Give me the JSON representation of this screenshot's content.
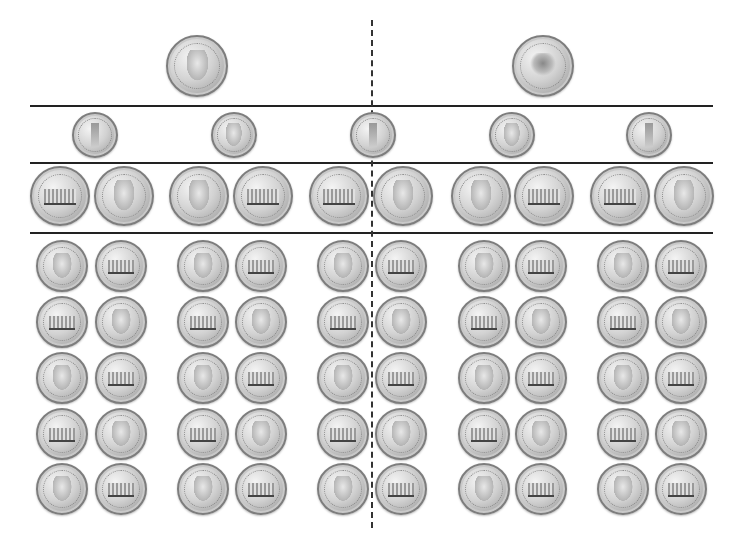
{
  "sheet": {
    "title": "",
    "layout": "coin equivalence chart: 1 quarter split into dimes, nickels, pennies",
    "colors": {
      "line": "#222222",
      "coin_silver": "#c8c8c8",
      "background": "#ffffff"
    }
  },
  "divider": {
    "style": "dashed",
    "orientation": "vertical",
    "x": 372
  },
  "rows": [
    {
      "name": "quarters",
      "y_center": 66,
      "radius": 31,
      "coins": [
        {
          "type": "quarter",
          "side": "heads",
          "x": 197,
          "top_text": "LIBERTY",
          "bottom_text": ""
        },
        {
          "type": "quarter",
          "side": "tails",
          "x": 543,
          "top_text": "UNITED STATES",
          "bottom_text": "QUARTER DOLLAR"
        }
      ]
    },
    {
      "name": "dimes",
      "y_center": 135,
      "radius": 23,
      "coins": [
        {
          "type": "dime",
          "side": "tails",
          "x": 95
        },
        {
          "type": "dime",
          "side": "heads",
          "x": 234
        },
        {
          "type": "dime",
          "side": "tails",
          "x": 373
        },
        {
          "type": "dime",
          "side": "heads",
          "x": 512
        },
        {
          "type": "dime",
          "side": "tails",
          "x": 649
        }
      ]
    },
    {
      "name": "nickels",
      "y_center": 196,
      "radius": 30,
      "coins": [
        {
          "type": "nickel",
          "side": "tails",
          "x": 60
        },
        {
          "type": "nickel",
          "side": "heads",
          "x": 124
        },
        {
          "type": "nickel",
          "side": "heads",
          "x": 199
        },
        {
          "type": "nickel",
          "side": "tails",
          "x": 263
        },
        {
          "type": "nickel",
          "side": "tails",
          "x": 339
        },
        {
          "type": "nickel",
          "side": "heads",
          "x": 403
        },
        {
          "type": "nickel",
          "side": "heads",
          "x": 481
        },
        {
          "type": "nickel",
          "side": "tails",
          "x": 544
        },
        {
          "type": "nickel",
          "side": "tails",
          "x": 620
        },
        {
          "type": "nickel",
          "side": "heads",
          "x": 684
        }
      ]
    }
  ],
  "pennies": {
    "radius": 26,
    "column_x": [
      62,
      121,
      203,
      261,
      343,
      401,
      484,
      541,
      623,
      681
    ],
    "row_y": [
      266,
      322,
      378,
      434,
      489
    ],
    "pattern": [
      [
        "heads",
        "tails"
      ],
      [
        "tails",
        "heads"
      ],
      [
        "heads",
        "tails"
      ],
      [
        "tails",
        "heads"
      ],
      [
        "heads",
        "tails"
      ]
    ],
    "heads_text": "LIBERTY",
    "tails_top_text": "UNITED STATES OF AMERICA",
    "tails_bottom_text": "ONE CENT"
  },
  "lines": [
    {
      "y": 106
    },
    {
      "y": 163
    },
    {
      "y": 233
    }
  ]
}
